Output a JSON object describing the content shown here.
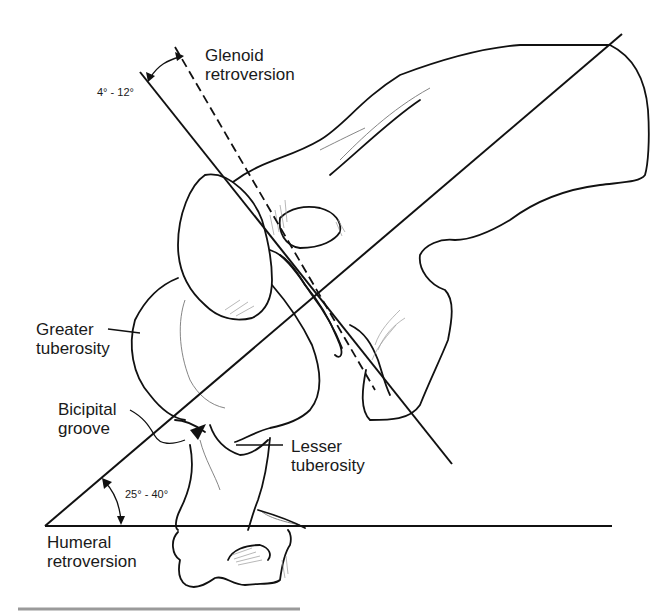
{
  "figure": {
    "labels": {
      "glenoid": "Glenoid\nretroversion",
      "glenoid_line1": "Glenoid",
      "glenoid_line2": "retroversion",
      "glenoid_angle": "4° - 12°",
      "greater_line1": "Greater",
      "greater_line2": "tuberosity",
      "bicipital_line1": "Bicipital",
      "bicipital_line2": "groove",
      "lesser_line1": "Lesser",
      "lesser_line2": "tuberosity",
      "humeral_angle": "25° - 40°",
      "humeral_line1": "Humeral",
      "humeral_line2": "retroversion"
    },
    "colors": {
      "ink": "#111111",
      "background": "#ffffff",
      "rule": "#9a9a9a"
    }
  }
}
